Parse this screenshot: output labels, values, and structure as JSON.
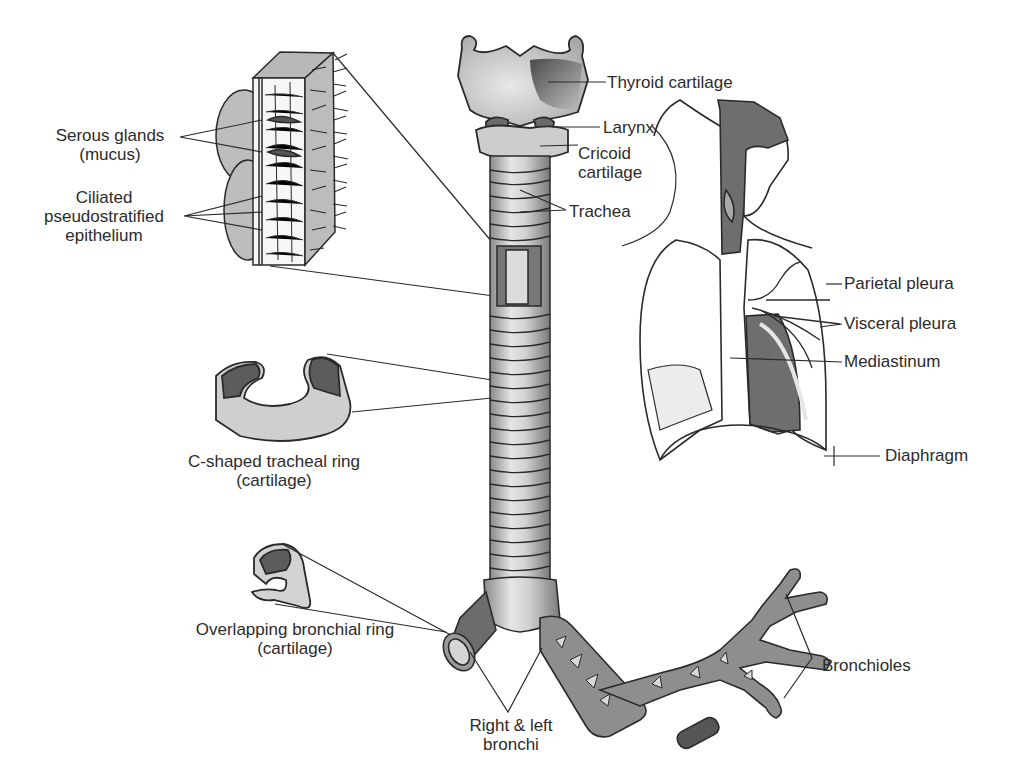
{
  "figure": {
    "colors": {
      "background": "#ffffff",
      "line": "#2a2a2a",
      "light_gray": "#c8c8c8",
      "mid_gray": "#9a9a9a",
      "dark_gray": "#5e5e5e"
    }
  },
  "labels": {
    "serous_glands": {
      "line1": "Serous glands",
      "line2": "(mucus)"
    },
    "ciliated": {
      "line1": "Ciliated",
      "line2": "pseudostratified",
      "line3": "epithelium"
    },
    "c_ring": {
      "line1": "C-shaped tracheal ring",
      "line2": "(cartilage)"
    },
    "bronchial_ring": {
      "line1": "Overlapping bronchial ring",
      "line2": "(cartilage)"
    },
    "thyroid": "Thyroid cartilage",
    "larynx": "Larynx",
    "cricoid": {
      "line1": "Cricoid",
      "line2": "cartilage"
    },
    "trachea": "Trachea",
    "parietal_pleura": "Parietal pleura",
    "visceral_pleura": "Visceral pleura",
    "mediastinum": "Mediastinum",
    "diaphragm": "Diaphragm",
    "bronchi": {
      "line1": "Right & left",
      "line2": "bronchi"
    },
    "bronchioles": "Bronchioles"
  }
}
